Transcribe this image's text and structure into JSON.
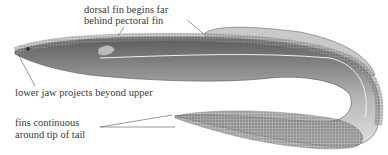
{
  "figure": {
    "labels": {
      "dorsal_fin_line1": "dorsal fin begins far",
      "dorsal_fin_line2": "behind pectoral fin",
      "lower_jaw": "lower jaw projects beyond upper",
      "fins_line1": "fins continuous",
      "fins_line2": "around tip of tail"
    },
    "colors": {
      "ink": "#3a3a3a",
      "body_dark": "#555555",
      "body_light": "#d8d8d8"
    }
  }
}
